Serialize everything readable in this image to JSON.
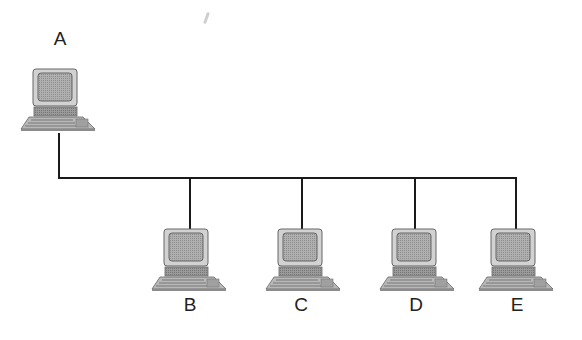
{
  "diagram": {
    "type": "bus-network-topology",
    "bus": {
      "y": 178,
      "x_start": 59,
      "x_end": 515,
      "color": "#1a1a1a"
    },
    "nodes": [
      {
        "id": "A",
        "label": "A",
        "x": 59,
        "computer_top": 68,
        "label_y": 30,
        "role": "uplink"
      },
      {
        "id": "B",
        "label": "B",
        "x": 190,
        "computer_top": 228,
        "label_y": 296
      },
      {
        "id": "C",
        "label": "C",
        "x": 302,
        "computer_top": 228,
        "label_y": 296
      },
      {
        "id": "D",
        "label": "D",
        "x": 415,
        "computer_top": 228,
        "label_y": 296
      },
      {
        "id": "E",
        "label": "E",
        "x": 516,
        "computer_top": 228,
        "label_y": 296
      }
    ],
    "colors": {
      "screen": "#a8a8a8",
      "monitor_frame": "#cfcfcf",
      "base": "#8c8c8c",
      "keyboard": "#9a9a9a",
      "outline": "#555555",
      "line": "#1a1a1a"
    }
  },
  "labels": {
    "a": "A",
    "b": "B",
    "c": "C",
    "d": "D",
    "e": "E"
  }
}
